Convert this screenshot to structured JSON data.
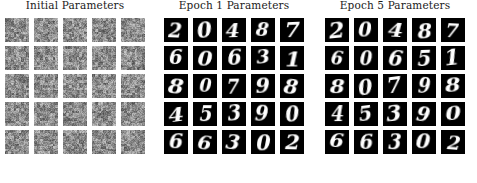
{
  "figure": {
    "background_color": "#ffffff",
    "title_color": "#1a1a1a",
    "tile_background": "#000000",
    "digit_color": "#fdfdfd",
    "noise_mean_color": "#8a8a8a",
    "grid_rows": 5,
    "grid_cols": 5,
    "tile_size_px": 24
  },
  "panels": [
    {
      "id": "initial-parameters",
      "title": "Initial Parameters",
      "sample_type": "noise",
      "rows": [
        [
          "noise",
          "noise",
          "noise",
          "noise",
          "noise"
        ],
        [
          "noise",
          "noise",
          "noise",
          "noise",
          "noise"
        ],
        [
          "noise",
          "noise",
          "noise",
          "noise",
          "noise"
        ],
        [
          "noise",
          "noise",
          "noise",
          "noise",
          "noise"
        ],
        [
          "noise",
          "noise",
          "noise",
          "noise",
          "noise"
        ]
      ]
    },
    {
      "id": "epoch-1-parameters",
      "title": "Epoch 1 Parameters",
      "sample_type": "digits",
      "rows": [
        [
          "2",
          "0",
          "4",
          "8",
          "7"
        ],
        [
          "6",
          "0",
          "6",
          "3",
          "1"
        ],
        [
          "8",
          "0",
          "7",
          "9",
          "8"
        ],
        [
          "4",
          "5",
          "3",
          "9",
          "0"
        ],
        [
          "6",
          "6",
          "3",
          "0",
          "2"
        ]
      ]
    },
    {
      "id": "epoch-5-parameters",
      "title": "Epoch 5 Parameters",
      "sample_type": "digits",
      "rows": [
        [
          "2",
          "0",
          "4",
          "8",
          "7"
        ],
        [
          "6",
          "0",
          "6",
          "5",
          "1"
        ],
        [
          "8",
          "0",
          "7",
          "9",
          "8"
        ],
        [
          "4",
          "5",
          "3",
          "9",
          "0"
        ],
        [
          "6",
          "6",
          "3",
          "0",
          "2"
        ]
      ]
    }
  ]
}
